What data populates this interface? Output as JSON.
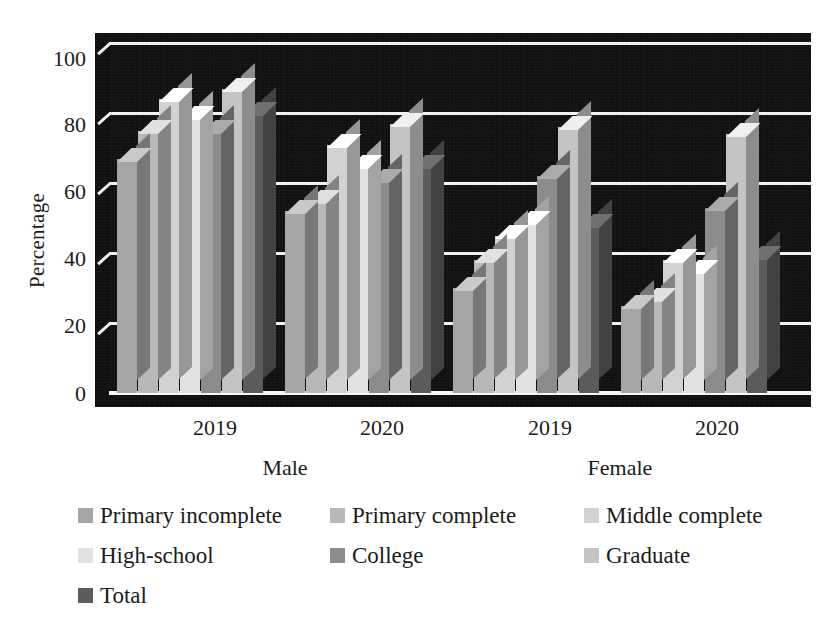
{
  "axis": {
    "y_title": "Percentage",
    "y_ticks": [
      "100",
      "80",
      "60",
      "40",
      "20",
      "0"
    ],
    "category_labels": [
      "2019",
      "2020",
      "2019",
      "2020"
    ],
    "group_labels": [
      "Male",
      "Female"
    ]
  },
  "legend": {
    "items": [
      {
        "label": "Primary incomplete",
        "color": "#a5a5a5"
      },
      {
        "label": "Primary complete",
        "color": "#b8b8b8"
      },
      {
        "label": "Middle complete",
        "color": "#d2d2d2"
      },
      {
        "label": "High-school",
        "color": "#e2e2e2"
      },
      {
        "label": "College",
        "color": "#8c8c8c"
      },
      {
        "label": "Graduate",
        "color": "#c4c4c4"
      },
      {
        "label": "Total",
        "color": "#5c5c5c"
      }
    ]
  },
  "chart_data": {
    "type": "bar",
    "title": "",
    "xlabel": "",
    "ylabel": "Percentage",
    "ylim": [
      0,
      100
    ],
    "ytick_step": 20,
    "grid": true,
    "legend_position": "bottom",
    "style": "3d-clustered-column",
    "categories": [
      "Male 2019",
      "Male 2020",
      "Female 2019",
      "Female 2020"
    ],
    "category_labels": [
      "2019",
      "2020",
      "2019",
      "2020"
    ],
    "group_labels": [
      "Male",
      "Female"
    ],
    "series": [
      {
        "name": "Primary incomplete",
        "color": "#a5a5a5",
        "values": [
          67,
          52,
          30,
          25
        ]
      },
      {
        "name": "Primary complete",
        "color": "#b8b8b8",
        "values": [
          75,
          55,
          38,
          27
        ]
      },
      {
        "name": "Middle complete",
        "color": "#d2d2d2",
        "values": [
          84,
          71,
          45,
          38
        ]
      },
      {
        "name": "High-school",
        "color": "#e2e2e2",
        "values": [
          79,
          65,
          49,
          35
        ]
      },
      {
        "name": "College",
        "color": "#8c8c8c",
        "values": [
          75,
          61,
          62,
          53
        ]
      },
      {
        "name": "Graduate",
        "color": "#c4c4c4",
        "values": [
          87,
          77,
          76,
          74
        ]
      },
      {
        "name": "Total",
        "color": "#5c5c5c",
        "values": [
          80,
          65,
          48,
          39
        ]
      }
    ]
  }
}
